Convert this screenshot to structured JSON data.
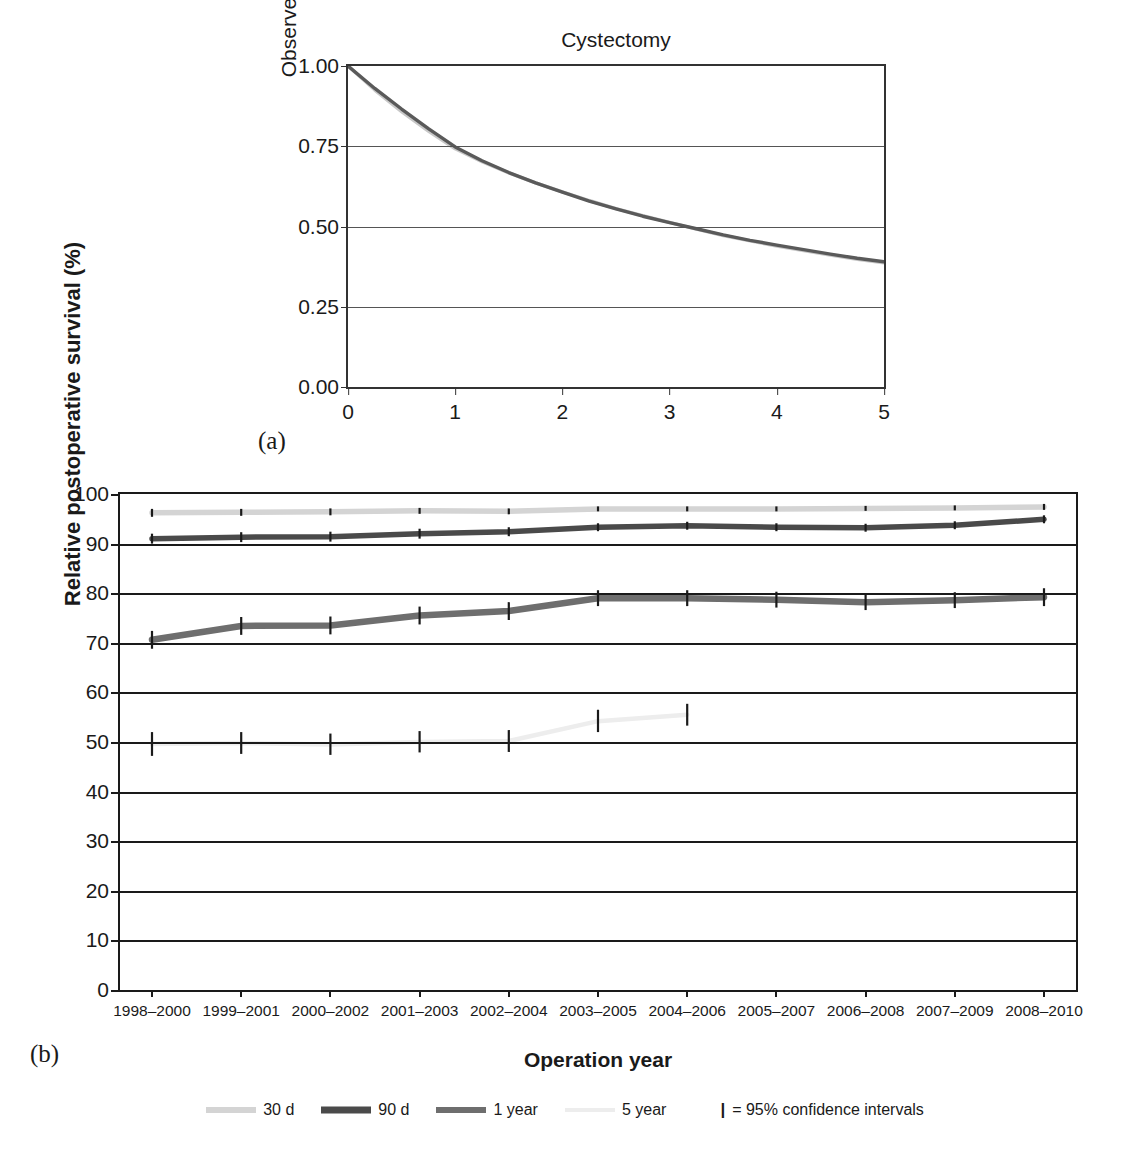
{
  "panel_a": {
    "panel_label": "(a)",
    "title": "Cystectomy",
    "ylabel": "Observed survival (proportion)",
    "xlabel": "Years",
    "yticks": [
      "0.00",
      "0.25",
      "0.50",
      "0.75",
      "1.00"
    ],
    "xticks": [
      "0",
      "1",
      "2",
      "3",
      "4",
      "5"
    ]
  },
  "panel_b": {
    "panel_label": "(b)",
    "ylabel": "Relative postoperative survival (%)",
    "xlabel": "Operation year",
    "yticks": [
      "0",
      "10",
      "20",
      "30",
      "40",
      "50",
      "60",
      "70",
      "80",
      "90",
      "100"
    ]
  },
  "legend": {
    "items": [
      {
        "label": "30 d",
        "color": "#d4d4d4"
      },
      {
        "label": "90 d",
        "color": "#4a4a4a"
      },
      {
        "label": "1 year",
        "color": "#6e6e6e"
      },
      {
        "label": "5 year",
        "color": "#ededed"
      }
    ],
    "ci_marker": "|",
    "ci_label": "= 95% confidence intervals"
  },
  "colors": {
    "axis": "#1a1a1a",
    "grid": "#1a1a1a",
    "series_30d": "#d4d4d4",
    "series_90d": "#4a4a4a",
    "series_1year": "#6e6e6e",
    "series_5year": "#ededed",
    "ci_bar": "#1a1a1a",
    "panel_a_dark": "#5a5a5a",
    "panel_a_light": "#c8c8c8"
  },
  "chart_data": [
    {
      "type": "line",
      "id": "panel-a",
      "title": "Cystectomy",
      "xlabel": "Years",
      "ylabel": "Observed survival (proportion)",
      "xlim": [
        0,
        5
      ],
      "ylim": [
        0.0,
        1.0
      ],
      "grid": true,
      "legend": "none",
      "x": [
        0,
        0.25,
        0.5,
        0.75,
        1,
        1.25,
        1.5,
        1.75,
        2,
        2.25,
        2.5,
        2.75,
        3,
        3.25,
        3.5,
        3.75,
        4,
        4.25,
        4.5,
        4.75,
        5
      ],
      "series": [
        {
          "name": "observed survival (dark)",
          "color": "#5a5a5a",
          "values": [
            1.0,
            0.93,
            0.866,
            0.805,
            0.748,
            0.705,
            0.668,
            0.636,
            0.607,
            0.579,
            0.555,
            0.532,
            0.512,
            0.493,
            0.474,
            0.457,
            0.442,
            0.428,
            0.414,
            0.401,
            0.39
          ]
        },
        {
          "name": "observed survival (light)",
          "color": "#c8c8c8",
          "values": [
            1.0,
            0.925,
            0.858,
            0.797,
            0.742,
            0.702,
            0.667,
            0.636,
            0.608,
            0.581,
            0.556,
            0.534,
            0.513,
            0.492,
            0.472,
            0.455,
            0.439,
            0.425,
            0.411,
            0.398,
            0.387
          ]
        }
      ]
    },
    {
      "type": "line",
      "id": "panel-b",
      "xlabel": "Operation year",
      "ylabel": "Relative postoperative survival (%)",
      "ylim": [
        0,
        100
      ],
      "grid": true,
      "legend": "bottom",
      "categories": [
        "1998–2000",
        "1999–2001",
        "2000–2002",
        "2001–2003",
        "2002–2004",
        "2003–2005",
        "2004–2006",
        "2005–2007",
        "2006–2008",
        "2007–2009",
        "2008–2010"
      ],
      "series": [
        {
          "name": "30 d",
          "color": "#d4d4d4",
          "values": [
            96.2,
            96.3,
            96.4,
            96.6,
            96.5,
            97.0,
            97.0,
            97.0,
            97.1,
            97.2,
            97.4
          ],
          "ci_low": [
            95.4,
            95.6,
            95.7,
            96.0,
            95.9,
            96.5,
            96.5,
            96.5,
            96.6,
            96.7,
            96.8
          ],
          "ci_high": [
            97.0,
            97.0,
            97.1,
            97.2,
            97.1,
            97.5,
            97.5,
            97.5,
            97.6,
            97.7,
            98.0
          ]
        },
        {
          "name": "90 d",
          "color": "#4a4a4a",
          "values": [
            91.0,
            91.3,
            91.4,
            92.0,
            92.4,
            93.3,
            93.6,
            93.3,
            93.2,
            93.7,
            94.9
          ],
          "ci_low": [
            90.0,
            90.3,
            90.4,
            91.0,
            91.5,
            92.5,
            92.8,
            92.5,
            92.4,
            92.9,
            94.1
          ],
          "ci_high": [
            92.0,
            92.3,
            92.4,
            93.0,
            93.3,
            94.1,
            94.4,
            94.1,
            94.0,
            94.5,
            95.7
          ]
        },
        {
          "name": "1 year",
          "color": "#6e6e6e",
          "values": [
            70.6,
            73.4,
            73.5,
            75.5,
            76.4,
            79.0,
            79.0,
            78.7,
            78.2,
            78.6,
            79.2
          ],
          "ci_low": [
            68.8,
            71.6,
            71.7,
            73.7,
            74.6,
            77.4,
            77.4,
            77.1,
            76.6,
            77.0,
            77.4
          ],
          "ci_high": [
            72.4,
            75.2,
            75.3,
            77.3,
            78.2,
            80.6,
            80.6,
            80.3,
            79.8,
            80.2,
            81.0
          ]
        },
        {
          "name": "5 year",
          "color": "#ededed",
          "values": [
            49.6,
            49.8,
            49.5,
            50.0,
            50.2,
            54.2,
            55.5,
            null,
            null,
            null,
            null
          ],
          "ci_low": [
            47.2,
            47.6,
            47.4,
            47.9,
            48.0,
            52.0,
            53.3,
            null,
            null,
            null,
            null
          ],
          "ci_high": [
            52.0,
            52.0,
            51.7,
            52.2,
            52.4,
            56.5,
            57.7,
            null,
            null,
            null,
            null
          ]
        }
      ]
    }
  ]
}
